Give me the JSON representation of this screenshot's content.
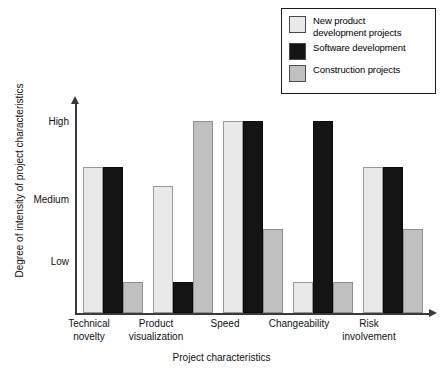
{
  "chart_data": {
    "type": "bar",
    "title": "",
    "xlabel": "Project characteristics",
    "ylabel": "Degree of intensity of project characteristics",
    "categories": [
      "Technical\nnovelty",
      "Product\nvisualization",
      "Speed",
      "Changeability",
      "Risk\ninvolvement"
    ],
    "ytick_labels": [
      "High",
      "Medium",
      "Low"
    ],
    "ytick_values": [
      3,
      2,
      1
    ],
    "ylim": [
      0,
      3.35
    ],
    "grid": false,
    "legend_position": "top-right",
    "series": [
      {
        "name": "New product\ndevelopment projects",
        "color": "#e9e9e9",
        "values": [
          2.35,
          2.05,
          3.1,
          0.5,
          2.35
        ]
      },
      {
        "name": "Software development",
        "color": "#141414",
        "values": [
          2.35,
          0.5,
          3.1,
          3.1,
          2.35
        ]
      },
      {
        "name": "Construction projects",
        "color": "#c0c0c0",
        "values": [
          0.5,
          3.1,
          1.35,
          0.5,
          1.35
        ]
      }
    ]
  },
  "legend": {
    "items": [
      {
        "label": "New product\ndevelopment projects",
        "color": "#e9e9e9"
      },
      {
        "label": "Software development",
        "color": "#141414"
      },
      {
        "label": "Construction projects",
        "color": "#c0c0c0"
      }
    ]
  },
  "axes": {
    "y_title": "Degree of intensity of project characteristics",
    "x_title": "Project characteristics",
    "y_ticks": [
      {
        "label": "High",
        "value": 3
      },
      {
        "label": "Medium",
        "value": 2
      },
      {
        "label": "Low",
        "value": 1
      }
    ],
    "x_ticks": [
      "Technical\nnovelty",
      "Product\nvisualization",
      "Speed",
      "Changeability",
      "Risk\ninvolvement"
    ]
  }
}
